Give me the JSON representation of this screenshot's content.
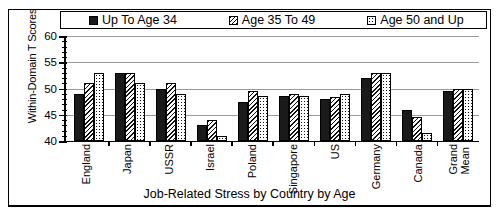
{
  "chart_data": {
    "type": "bar",
    "title": "",
    "xlabel": "Job-Related Stress by Country by Age",
    "ylabel": "Within-Domain T Scores",
    "ylim": [
      40,
      60
    ],
    "yticks": [
      40,
      45,
      50,
      55,
      60
    ],
    "ytick_labels": [
      "40",
      "45",
      "50",
      "55",
      "60"
    ],
    "minor_ticks": true,
    "grid": true,
    "legend_position": "top",
    "categories": [
      "England",
      "Japan",
      "USSR",
      "Israel",
      "Poland",
      "Singapore",
      "US",
      "Germany",
      "Canada",
      "Grand\nMean"
    ],
    "series": [
      {
        "name": "Up To Age 34",
        "pattern": "solid",
        "values": [
          49.0,
          53.0,
          50.0,
          43.0,
          47.5,
          48.5,
          48.0,
          52.0,
          46.0,
          49.5
        ]
      },
      {
        "name": "Age 35 To 49",
        "pattern": "hatch",
        "values": [
          51.0,
          53.0,
          51.0,
          44.0,
          49.5,
          49.0,
          48.3,
          53.0,
          44.5,
          50.0
        ]
      },
      {
        "name": "Age 50 and Up",
        "pattern": "dots",
        "values": [
          53.0,
          51.0,
          49.0,
          41.0,
          48.5,
          48.5,
          49.0,
          53.0,
          41.5,
          50.0
        ]
      }
    ]
  },
  "legend": {
    "items": [
      {
        "label": "Up To Age 34",
        "swatch": "solid-square-icon"
      },
      {
        "label": "Age 35 To 49",
        "swatch": "hatched-square-icon"
      },
      {
        "label": "Age 50 and Up",
        "swatch": "dotted-square-icon"
      }
    ]
  },
  "axes": {
    "y_title": "Within-Domain T Scores",
    "x_title": "Job-Related Stress by Country by Age"
  },
  "colors": {
    "series_1": "#1a1a1a",
    "series_2": "#ffffff",
    "series_3": "#ffffff",
    "outline": "#000000",
    "gridline": "#9a9a9a",
    "background": "#ffffff"
  }
}
